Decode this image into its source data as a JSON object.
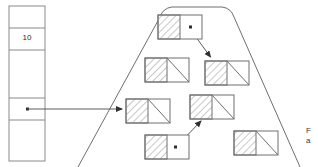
{
  "diagram": {
    "type": "pointer-structure-diagram",
    "background": "#ffffff",
    "stroke": "#6e6e6e",
    "stroke_dark": "#3c3c3c",
    "hatch_color": "#9a9a9a",
    "width": 318,
    "height": 167
  },
  "array": {
    "name": "pointer-array",
    "x": 9,
    "y": 6,
    "width": 36,
    "height": 155,
    "cells": [
      {
        "index": 0,
        "label": "",
        "y": 6,
        "height": 22,
        "has_pointer_dot": false
      },
      {
        "index": 1,
        "label": "10",
        "y": 28,
        "height": 22,
        "has_pointer_dot": false
      },
      {
        "index": 2,
        "label": "",
        "y": 50,
        "height": 48,
        "has_pointer_dot": false
      },
      {
        "index": 3,
        "label": "",
        "y": 98,
        "height": 22,
        "has_pointer_dot": true
      },
      {
        "index": 4,
        "label": "",
        "y": 120,
        "height": 41,
        "has_pointer_dot": false
      }
    ]
  },
  "heap_region": {
    "name": "heap-boundary",
    "shape": "rounded-trapezoid",
    "top_left_x": 162,
    "top_right_x": 232,
    "bottom_left_x": 78,
    "bottom_right_x": 300,
    "top_y": 7,
    "bottom_y": 167,
    "corner_radius": 10
  },
  "nodes": [
    {
      "id": "n1",
      "name": "node-top",
      "x": 158,
      "y": 15,
      "w": 44,
      "h": 24,
      "pointer_kind": "dot"
    },
    {
      "id": "n2",
      "name": "node-mid-left",
      "x": 145,
      "y": 58,
      "w": 44,
      "h": 24,
      "pointer_kind": "null"
    },
    {
      "id": "n3",
      "name": "node-mid-right",
      "x": 205,
      "y": 61,
      "w": 44,
      "h": 24,
      "pointer_kind": "null"
    },
    {
      "id": "n4",
      "name": "node-left",
      "x": 126,
      "y": 99,
      "w": 44,
      "h": 24,
      "pointer_kind": "null"
    },
    {
      "id": "n5",
      "name": "node-center",
      "x": 190,
      "y": 95,
      "w": 44,
      "h": 24,
      "pointer_kind": "null"
    },
    {
      "id": "n6",
      "name": "node-bottom-left",
      "x": 145,
      "y": 135,
      "w": 44,
      "h": 24,
      "pointer_kind": "dot"
    },
    {
      "id": "n7",
      "name": "node-bottom-right",
      "x": 234,
      "y": 131,
      "w": 44,
      "h": 24,
      "pointer_kind": "null"
    }
  ],
  "arrows": [
    {
      "name": "arrow-array-to-node-left",
      "from": "array-cell-3",
      "to": "n4",
      "x1": 28,
      "y1": 109,
      "x2": 124,
      "y2": 109,
      "style": "straight-horizontal"
    },
    {
      "name": "arrow-node-top-to-node-mid-right",
      "from": "n1",
      "to": "n3",
      "x1": 190,
      "y1": 29,
      "x2": 212,
      "y2": 59,
      "style": "straight-diagonal"
    },
    {
      "name": "arrow-node-bottom-left-to-node-center",
      "from": "n6",
      "to": "n5",
      "x1": 175,
      "y1": 147,
      "x2": 200,
      "y2": 122,
      "style": "straight-diagonal"
    }
  ],
  "edge_text": "Fi\na"
}
